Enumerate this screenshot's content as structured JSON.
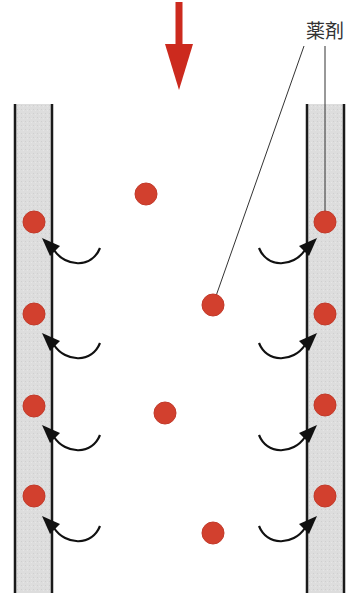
{
  "diagram": {
    "title": "",
    "label_drug": "薬剤",
    "colors": {
      "particle": "#d2402e",
      "particle_edge": "#c23a2a",
      "flow_arrow": "#cc2a1e",
      "wall_fill": "#dcdcdc",
      "wall_line": "#1a1a1a",
      "absorb_arrow": "#111111",
      "leader_line": "#333333"
    },
    "flow_arrow": {
      "direction": "down",
      "x": 179,
      "y_start": 2,
      "y_end": 90
    },
    "walls": [
      {
        "side": "left",
        "x_outer": 15,
        "x_inner": 52,
        "y_top": 104,
        "y_bottom": 593
      },
      {
        "side": "right",
        "x_inner": 307,
        "x_outer": 344,
        "y_top": 104,
        "y_bottom": 593
      }
    ],
    "free_particles": [
      {
        "x": 146,
        "y": 194
      },
      {
        "x": 213,
        "y": 305
      },
      {
        "x": 165,
        "y": 413
      },
      {
        "x": 213,
        "y": 533
      }
    ],
    "wall_particles_left": [
      {
        "x": 34,
        "y": 222
      },
      {
        "x": 34,
        "y": 314
      },
      {
        "x": 34,
        "y": 406
      },
      {
        "x": 34,
        "y": 496
      }
    ],
    "wall_particles_right": [
      {
        "x": 325,
        "y": 222
      },
      {
        "x": 325,
        "y": 314
      },
      {
        "x": 325,
        "y": 405
      },
      {
        "x": 325,
        "y": 496
      }
    ],
    "absorb_arrows_y": [
      250,
      345,
      437,
      528
    ],
    "leader_lines": [
      {
        "from": [
          304,
          46
        ],
        "to": [
          216,
          296
        ]
      },
      {
        "from": [
          325,
          46
        ],
        "to": [
          325,
          212
        ]
      }
    ]
  }
}
